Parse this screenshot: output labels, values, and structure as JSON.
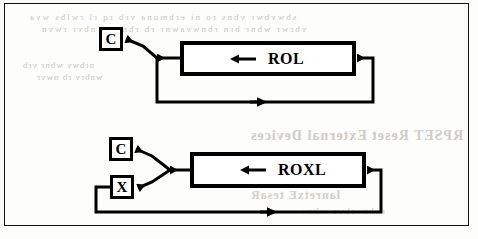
{
  "figure": {
    "frame_color": "#111111",
    "ink_color": "#000000",
    "paper_color": "#fdfdfc"
  },
  "diagrams": [
    {
      "id": "rol",
      "operation_label": "ROL",
      "inner_arrow_direction": "left",
      "flags": [
        {
          "id": "rol-carry",
          "label": "C",
          "name": "carry-flag"
        }
      ],
      "feedback_loop": true,
      "feedback_arrow_direction": "right"
    },
    {
      "id": "roxl",
      "operation_label": "ROXL",
      "inner_arrow_direction": "left",
      "flags": [
        {
          "id": "roxl-carry",
          "label": "C",
          "name": "carry-flag"
        },
        {
          "id": "roxl-extend",
          "label": "X",
          "name": "extend-flag"
        }
      ],
      "feedback_loop": true,
      "feedback_arrow_direction": "right"
    }
  ],
  "bleed_through": {
    "note": "faint mirrored text showing through from the reverse side of the scanned page",
    "lines": [
      "sbwvbwr vbns ro ni  erbmuna  vrb rq rl  rwlbs wva",
      "vbrwr  wbnr   brn rbnwvawnr rb rbnvwa  nbvr  rwvn",
      "nrbwv wbnr vrb",
      "wnbrv  rb nwvr",
      "RPSET   Reset External Devices",
      "lanretxE tesaR",
      "rwbnv rbwn vrbnw",
      "wnrb vwrbn"
    ]
  }
}
